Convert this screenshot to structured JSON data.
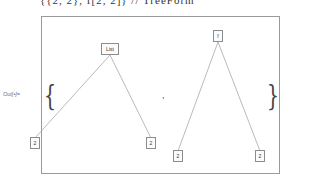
{
  "input": {
    "text": "{{2, 2}, f[2, 2]} // TreeForm"
  },
  "output": {
    "label": "Out[•]=",
    "open_brace": "{",
    "close_brace": "}",
    "separator": ",",
    "trees": [
      {
        "root": {
          "label": "List",
          "x": 110,
          "y": 49
        },
        "children": [
          {
            "label": "2",
            "x": 35,
            "y": 143
          },
          {
            "label": "2",
            "x": 151,
            "y": 143
          }
        ]
      },
      {
        "root": {
          "label": "f",
          "x": 218,
          "y": 36
        },
        "children": [
          {
            "label": "2",
            "x": 178,
            "y": 156
          },
          {
            "label": "2",
            "x": 260,
            "y": 156
          }
        ]
      }
    ]
  },
  "colors": {
    "edge": "#a8a8a8",
    "node_border": "#8c8c8c",
    "frame_border": "#9a9a9a",
    "label": "#5a6f8f"
  }
}
